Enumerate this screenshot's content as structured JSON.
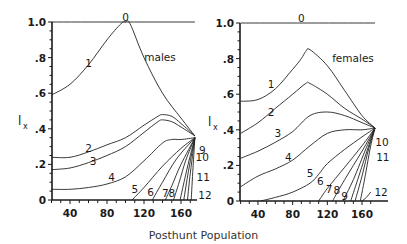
{
  "chart_data": [
    {
      "type": "line",
      "panel": "males",
      "title": "males",
      "xlabel": "Posthunt Population",
      "ylabel": "l_x",
      "xlim": [
        20,
        175
      ],
      "ylim": [
        0,
        1.0
      ],
      "xticks": [
        40,
        80,
        120,
        160
      ],
      "yticks": [
        {
          "v": 0,
          "t": "0"
        },
        {
          "v": 0.2,
          "t": ".2"
        },
        {
          "v": 0.4,
          "t": ".4"
        },
        {
          "v": 0.6,
          "t": ".6"
        },
        {
          "v": 0.8,
          "t": ".8"
        },
        {
          "v": 1.0,
          "t": "1.0"
        }
      ],
      "series": [
        {
          "name": "0",
          "x": [
            20,
            175
          ],
          "y": [
            1.0,
            1.0
          ],
          "label": {
            "x": 100,
            "y": 1.03
          }
        },
        {
          "name": "1",
          "x": [
            20,
            40,
            60,
            80,
            95,
            100,
            105,
            120,
            140,
            160,
            175
          ],
          "y": [
            0.59,
            0.65,
            0.76,
            0.9,
            0.99,
            1.0,
            0.99,
            0.8,
            0.6,
            0.46,
            0.36
          ],
          "label": {
            "x": 60,
            "y": 0.77
          }
        },
        {
          "name": "2",
          "x": [
            20,
            40,
            60,
            80,
            100,
            120,
            135,
            140,
            150,
            160,
            175
          ],
          "y": [
            0.24,
            0.24,
            0.27,
            0.31,
            0.35,
            0.42,
            0.47,
            0.48,
            0.47,
            0.43,
            0.36
          ],
          "label": {
            "x": 60,
            "y": 0.29
          }
        },
        {
          "name": "3",
          "x": [
            20,
            40,
            60,
            80,
            100,
            120,
            135,
            140,
            150,
            160,
            175
          ],
          "y": [
            0.17,
            0.18,
            0.21,
            0.25,
            0.3,
            0.38,
            0.44,
            0.45,
            0.44,
            0.41,
            0.36
          ],
          "label": {
            "x": 65,
            "y": 0.22
          }
        },
        {
          "name": "4",
          "x": [
            20,
            40,
            60,
            80,
            100,
            120,
            140,
            150,
            160,
            175
          ],
          "y": [
            0.06,
            0.06,
            0.07,
            0.09,
            0.13,
            0.22,
            0.32,
            0.34,
            0.34,
            0.35
          ],
          "label": {
            "x": 85,
            "y": 0.13
          }
        },
        {
          "name": "5",
          "x": [
            107,
            120,
            140,
            160,
            175
          ],
          "y": [
            0,
            0.07,
            0.19,
            0.29,
            0.35
          ],
          "label": {
            "x": 110,
            "y": 0.06
          }
        },
        {
          "name": "6",
          "x": [
            129,
            140,
            155,
            175
          ],
          "y": [
            0,
            0.1,
            0.23,
            0.35
          ],
          "label": {
            "x": 127,
            "y": 0.045
          }
        },
        {
          "name": "7",
          "x": [
            143,
            150,
            160,
            175
          ],
          "y": [
            0,
            0.08,
            0.2,
            0.35
          ],
          "label": {
            "x": 143,
            "y": 0.04
          }
        },
        {
          "name": "8",
          "x": [
            152,
            158,
            165,
            175
          ],
          "y": [
            0,
            0.1,
            0.22,
            0.35
          ],
          "label": {
            "x": 150,
            "y": 0.04
          }
        },
        {
          "name": "9",
          "x": [
            159,
            165,
            170,
            175
          ],
          "y": [
            0,
            0.14,
            0.25,
            0.35
          ],
          "label": {
            "x": 183,
            "y": 0.28
          }
        },
        {
          "name": "10",
          "x": [
            163,
            168,
            172,
            175
          ],
          "y": [
            0,
            0.16,
            0.27,
            0.35
          ],
          "label": {
            "x": 183,
            "y": 0.24
          }
        },
        {
          "name": "11",
          "x": [
            167,
            170,
            173,
            175
          ],
          "y": [
            0,
            0.15,
            0.27,
            0.35
          ],
          "label": {
            "x": 184,
            "y": 0.13
          }
        },
        {
          "name": "12",
          "x": [
            171,
            173,
            175
          ],
          "y": [
            0,
            0.18,
            0.35
          ],
          "label": {
            "x": 186,
            "y": 0.03
          }
        }
      ]
    },
    {
      "type": "line",
      "panel": "females",
      "title": "females",
      "xlabel": "Posthunt Population",
      "ylabel": "l_x",
      "xlim": [
        20,
        175
      ],
      "ylim": [
        0,
        1.0
      ],
      "xticks": [
        40,
        80,
        120,
        160
      ],
      "yticks": [
        {
          "v": 0,
          "t": "0"
        },
        {
          "v": 0.2,
          "t": ".2"
        },
        {
          "v": 0.4,
          "t": ".4"
        },
        {
          "v": 0.6,
          "t": ".6"
        },
        {
          "v": 0.8,
          "t": ".8"
        },
        {
          "v": 1.0,
          "t": "1.0"
        }
      ],
      "series": [
        {
          "name": "0",
          "x": [
            20,
            175
          ],
          "y": [
            1.0,
            1.0
          ],
          "label": {
            "x": 90,
            "y": 1.03
          }
        },
        {
          "name": "1",
          "x": [
            20,
            40,
            60,
            80,
            90,
            95,
            100,
            120,
            140,
            160,
            175
          ],
          "y": [
            0.56,
            0.57,
            0.63,
            0.74,
            0.8,
            0.84,
            0.85,
            0.76,
            0.62,
            0.48,
            0.41
          ],
          "label": {
            "x": 55,
            "y": 0.66
          }
        },
        {
          "name": "2",
          "x": [
            20,
            40,
            60,
            80,
            95,
            100,
            120,
            140,
            160,
            175
          ],
          "y": [
            0.38,
            0.44,
            0.52,
            0.6,
            0.66,
            0.66,
            0.6,
            0.52,
            0.46,
            0.41
          ],
          "label": {
            "x": 55,
            "y": 0.5
          }
        },
        {
          "name": "3",
          "x": [
            20,
            40,
            60,
            80,
            100,
            120,
            140,
            160,
            175
          ],
          "y": [
            0.24,
            0.28,
            0.33,
            0.39,
            0.48,
            0.5,
            0.48,
            0.44,
            0.41
          ],
          "label": {
            "x": 63,
            "y": 0.38
          }
        },
        {
          "name": "4",
          "x": [
            20,
            40,
            60,
            80,
            100,
            120,
            140,
            160,
            175
          ],
          "y": [
            0.08,
            0.14,
            0.18,
            0.23,
            0.31,
            0.38,
            0.4,
            0.4,
            0.41
          ],
          "label": {
            "x": 75,
            "y": 0.25
          }
        },
        {
          "name": "5",
          "x": [
            43,
            60,
            80,
            100,
            110,
            120,
            140,
            160,
            175
          ],
          "y": [
            0,
            0.02,
            0.05,
            0.1,
            0.15,
            0.21,
            0.29,
            0.36,
            0.41
          ],
          "label": {
            "x": 100,
            "y": 0.16
          }
        },
        {
          "name": "6",
          "x": [
            110,
            120,
            140,
            160,
            175
          ],
          "y": [
            0,
            0.07,
            0.19,
            0.31,
            0.41
          ],
          "label": {
            "x": 112,
            "y": 0.11
          }
        },
        {
          "name": "7",
          "x": [
            126,
            140,
            160,
            175
          ],
          "y": [
            0,
            0.12,
            0.28,
            0.41
          ],
          "label": {
            "x": 122,
            "y": 0.07
          }
        },
        {
          "name": "8",
          "x": [
            138,
            150,
            165,
            175
          ],
          "y": [
            0,
            0.12,
            0.3,
            0.41
          ],
          "label": {
            "x": 131,
            "y": 0.06
          }
        },
        {
          "name": "9",
          "x": [
            147,
            155,
            167,
            175
          ],
          "y": [
            0,
            0.12,
            0.3,
            0.41
          ],
          "label": {
            "x": 140,
            "y": 0.03
          }
        },
        {
          "name": "10",
          "x": [
            152,
            160,
            168,
            175
          ],
          "y": [
            0,
            0.14,
            0.3,
            0.41
          ],
          "label": {
            "x": 183,
            "y": 0.33
          }
        },
        {
          "name": "11",
          "x": [
            158,
            164,
            170,
            175
          ],
          "y": [
            0,
            0.15,
            0.31,
            0.41
          ],
          "label": {
            "x": 184,
            "y": 0.25
          }
        },
        {
          "name": "12",
          "x": [
            160,
            165,
            170
          ],
          "y": [
            0,
            0.02,
            0.05
          ],
          "label": {
            "x": 182,
            "y": 0.05
          }
        }
      ]
    }
  ],
  "figure": {
    "xtitle": "Posthunt Population",
    "ylabel_main": "l",
    "ylabel_sub": "x"
  }
}
